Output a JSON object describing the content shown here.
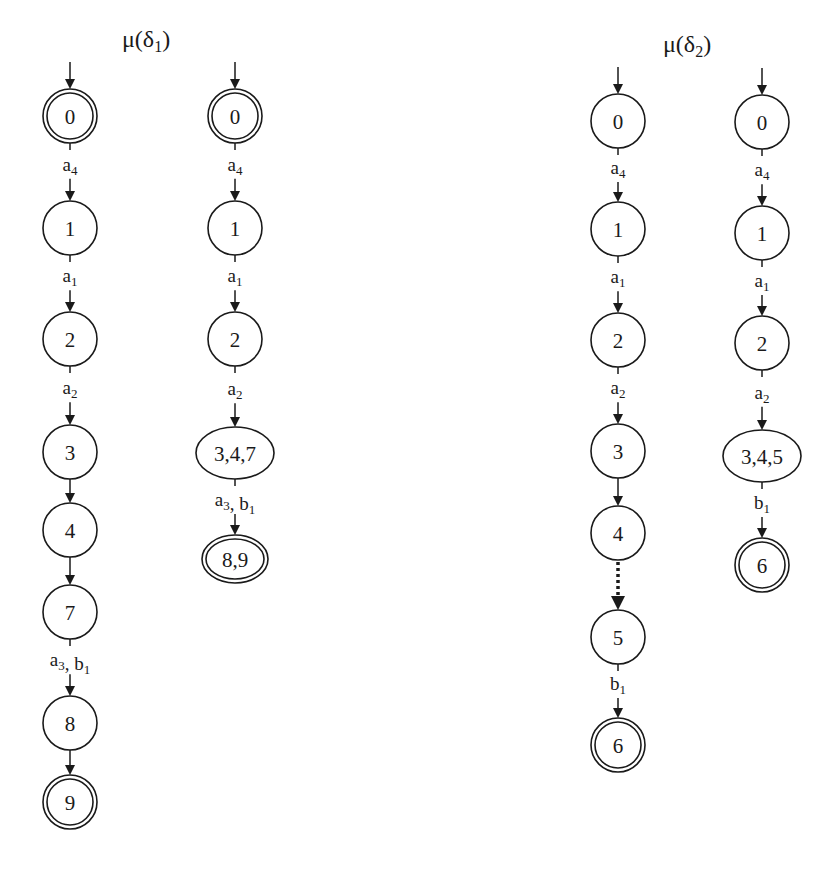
{
  "diagram": {
    "type": "state-machines",
    "groups": [
      {
        "title": {
          "base": "μ(δ",
          "sub": "1",
          "suffix": ")"
        },
        "automata": [
          {
            "id": "mu-delta1-left",
            "states": [
              {
                "id": "0",
                "label": "0",
                "initial": true,
                "accepting": true
              },
              {
                "id": "1",
                "label": "1"
              },
              {
                "id": "2",
                "label": "2"
              },
              {
                "id": "3",
                "label": "3"
              },
              {
                "id": "4",
                "label": "4"
              },
              {
                "id": "7",
                "label": "7"
              },
              {
                "id": "8",
                "label": "8"
              },
              {
                "id": "9",
                "label": "9",
                "accepting": true
              }
            ],
            "transitions": [
              {
                "from": "0",
                "to": "1",
                "label": [
                  {
                    "t": "a",
                    "s": "4"
                  }
                ]
              },
              {
                "from": "1",
                "to": "2",
                "label": [
                  {
                    "t": "a",
                    "s": "1"
                  }
                ]
              },
              {
                "from": "2",
                "to": "3",
                "label": [
                  {
                    "t": "a",
                    "s": "2"
                  }
                ]
              },
              {
                "from": "3",
                "to": "4",
                "label": []
              },
              {
                "from": "4",
                "to": "7",
                "label": []
              },
              {
                "from": "7",
                "to": "8",
                "label": [
                  {
                    "t": "a",
                    "s": "3"
                  },
                  {
                    "t": ", b",
                    "s": "1"
                  }
                ]
              },
              {
                "from": "8",
                "to": "9",
                "label": []
              }
            ]
          },
          {
            "id": "mu-delta1-right",
            "states": [
              {
                "id": "0",
                "label": "0",
                "initial": true,
                "accepting": true
              },
              {
                "id": "1",
                "label": "1"
              },
              {
                "id": "2",
                "label": "2"
              },
              {
                "id": "347",
                "label": "3,4,7",
                "shape": "ellipse"
              },
              {
                "id": "89",
                "label": "8,9",
                "shape": "ellipse",
                "accepting": true
              }
            ],
            "transitions": [
              {
                "from": "0",
                "to": "1",
                "label": [
                  {
                    "t": "a",
                    "s": "4"
                  }
                ]
              },
              {
                "from": "1",
                "to": "2",
                "label": [
                  {
                    "t": "a",
                    "s": "1"
                  }
                ]
              },
              {
                "from": "2",
                "to": "347",
                "label": [
                  {
                    "t": "a",
                    "s": "2"
                  }
                ]
              },
              {
                "from": "347",
                "to": "89",
                "label": [
                  {
                    "t": "a",
                    "s": "3"
                  },
                  {
                    "t": ", b",
                    "s": "1"
                  }
                ]
              }
            ]
          }
        ]
      },
      {
        "title": {
          "base": "μ(δ",
          "sub": "2",
          "suffix": ")"
        },
        "automata": [
          {
            "id": "mu-delta2-left",
            "states": [
              {
                "id": "0",
                "label": "0",
                "initial": true
              },
              {
                "id": "1",
                "label": "1"
              },
              {
                "id": "2",
                "label": "2"
              },
              {
                "id": "3",
                "label": "3"
              },
              {
                "id": "4",
                "label": "4"
              },
              {
                "id": "5",
                "label": "5"
              },
              {
                "id": "6",
                "label": "6",
                "accepting": true
              }
            ],
            "transitions": [
              {
                "from": "0",
                "to": "1",
                "label": [
                  {
                    "t": "a",
                    "s": "4"
                  }
                ]
              },
              {
                "from": "1",
                "to": "2",
                "label": [
                  {
                    "t": "a",
                    "s": "1"
                  }
                ]
              },
              {
                "from": "2",
                "to": "3",
                "label": [
                  {
                    "t": "a",
                    "s": "2"
                  }
                ]
              },
              {
                "from": "3",
                "to": "4",
                "label": []
              },
              {
                "from": "4",
                "to": "5",
                "label": [],
                "style": "dotted"
              },
              {
                "from": "5",
                "to": "6",
                "label": [
                  {
                    "t": "b",
                    "s": "1"
                  }
                ]
              }
            ]
          },
          {
            "id": "mu-delta2-right",
            "states": [
              {
                "id": "0",
                "label": "0",
                "initial": true
              },
              {
                "id": "1",
                "label": "1"
              },
              {
                "id": "2",
                "label": "2"
              },
              {
                "id": "345",
                "label": "3,4,5",
                "shape": "ellipse"
              },
              {
                "id": "6",
                "label": "6",
                "accepting": true
              }
            ],
            "transitions": [
              {
                "from": "0",
                "to": "1",
                "label": [
                  {
                    "t": "a",
                    "s": "4"
                  }
                ]
              },
              {
                "from": "1",
                "to": "2",
                "label": [
                  {
                    "t": "a",
                    "s": "1"
                  }
                ]
              },
              {
                "from": "2",
                "to": "345",
                "label": [
                  {
                    "t": "a",
                    "s": "2"
                  }
                ]
              },
              {
                "from": "345",
                "to": "6",
                "label": [
                  {
                    "t": "b",
                    "s": "1"
                  }
                ]
              }
            ]
          }
        ]
      }
    ]
  }
}
